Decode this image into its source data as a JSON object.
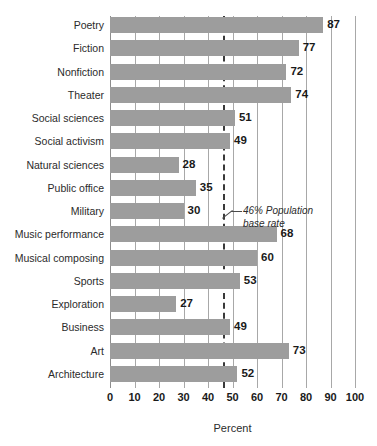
{
  "chart_data": {
    "type": "bar",
    "orientation": "horizontal",
    "title": "",
    "subtitle": "",
    "xlabel": "Percent",
    "ylabel": "",
    "xlim": [
      0,
      100
    ],
    "xticks": [
      0,
      10,
      20,
      30,
      40,
      50,
      60,
      70,
      80,
      90,
      100
    ],
    "xtick_labels": [
      "0",
      "10",
      "20",
      "30",
      "40",
      "50",
      "60",
      "70",
      "80",
      "90",
      "100"
    ],
    "grid": "vertical",
    "legend": "none",
    "categories": [
      "Poetry",
      "Fiction",
      "Nonfiction",
      "Theater",
      "Social sciences",
      "Social activism",
      "Natural sciences",
      "Public office",
      "Military",
      "Music performance",
      "Musical composing",
      "Sports",
      "Exploration",
      "Business",
      "Art",
      "Architecture"
    ],
    "values": [
      87,
      77,
      72,
      74,
      51,
      49,
      28,
      35,
      30,
      68,
      60,
      53,
      27,
      49,
      73,
      52
    ],
    "value_labels": [
      "87",
      "77",
      "72",
      "74",
      "51",
      "49",
      "28",
      "35",
      "30",
      "68",
      "60",
      "53",
      "27",
      "49",
      "73",
      "52"
    ],
    "reference_line": {
      "value": 46,
      "style": "dashed",
      "label_line_1": "46% Population",
      "label_line_2": "base rate"
    },
    "colors": {
      "bar": "#9d9d9d",
      "grid": "#a8a8a8",
      "reference_line": "#3a3a3a",
      "text": "#2b2b2b",
      "value_text": "#1a1a1a",
      "background": "#ffffff"
    }
  }
}
